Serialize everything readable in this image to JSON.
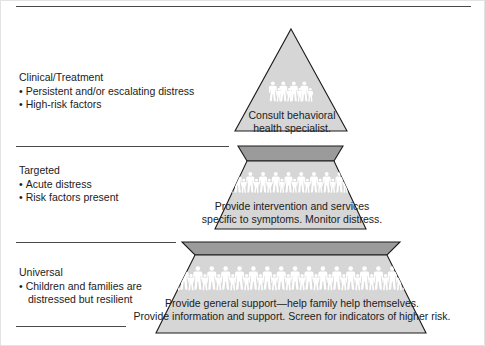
{
  "figure": {
    "colors": {
      "tier_light": "#d6d6d6",
      "tier_shadow": "#9b9b9b",
      "outline": "#1b1b1b",
      "figure_silhouette": "#ffffff",
      "rule": "#4a4a4a",
      "text": "#1b1b1b",
      "background": "#ffffff"
    }
  },
  "left_labels": [
    {
      "id": "clinical",
      "heading": "Clinical/Treatment",
      "bullets": [
        "Persistent and/or escalating distress",
        "High-risk factors"
      ]
    },
    {
      "id": "targeted",
      "heading": "Targeted",
      "bullets": [
        "Acute distress",
        "Risk factors present"
      ]
    },
    {
      "id": "universal",
      "heading": "Universal",
      "bullets": [
        "Children and families are",
        "distressed but resilient"
      ]
    }
  ],
  "bullet_glyph": "•",
  "tiers": [
    {
      "id": "clinical-treatment",
      "level": "top",
      "lines": [
        "Consult behavioral",
        "health specialist."
      ],
      "figure_count": 4
    },
    {
      "id": "targeted",
      "level": "middle",
      "lines": [
        "Provide intervention and services",
        "specific to symptoms. Monitor distress."
      ],
      "figure_count": 11
    },
    {
      "id": "universal",
      "level": "bottom",
      "lines": [
        "Provide general support—help family help themselves.",
        "Provide information and support. Screen for indicators of higher risk."
      ],
      "figure_count": 18
    }
  ]
}
